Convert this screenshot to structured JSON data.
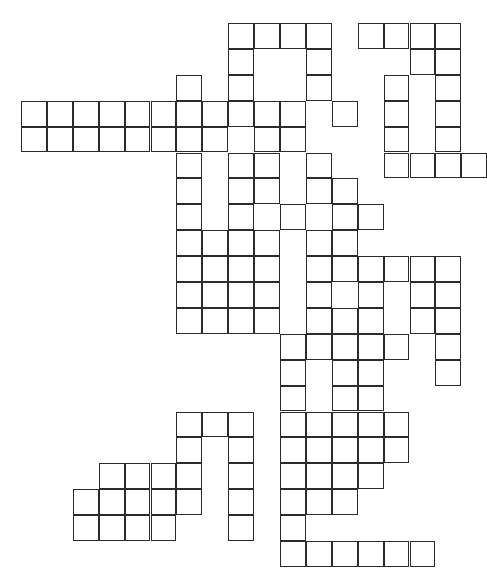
{
  "puzzle": {
    "type": "crossword-grid",
    "title": "Crossword puzzle grid",
    "description": "Blank interlocking crossword grid of empty white cells with black outlines on a white background.",
    "grid": {
      "columns": 17,
      "rows": 21,
      "cell_size": 25.9,
      "origin_x": 21,
      "origin_y": 23,
      "line_color": "#2b2b2b",
      "cell_fill": "#ffffff",
      "background": "#ffffff",
      "filled_cell_count": 179,
      "legend": "# = open (white) cell, . = empty space (no cell)",
      "cells": [
        "........####.####",
        "........#..#...##",
        "......#.#..#..#.#",
        "###########.#.#.#",
        "########.##...#.#",
        "......#.##.#..####",
        "......#.##.##....",
        "......#.#.#.##...",
        "......####.##....",
        "......####.######",
        "......####.#.#.##",
        "......####.###.##",
        "..........#####.#",
        "..........#.##..#",
        "..........#.##...",
        "......###.#####..",
        "......#.#.#####..",
        "...####.#.####...",
        "..#####.#.###....",
        "..####..#.#......",
        "..........######."
      ]
    }
  }
}
